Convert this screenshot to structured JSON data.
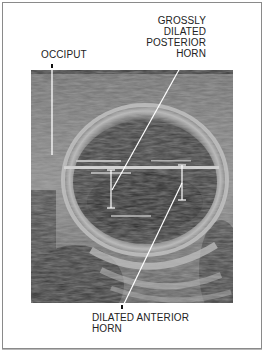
{
  "figure": {
    "type": "ultrasound-annotated",
    "labels": {
      "occiput": "OCCIPUT",
      "posterior_horn": [
        "GROSSLY",
        "DILATED",
        "POSTERIOR",
        "HORN"
      ],
      "anterior_horn": [
        "DILATED ANTERIOR",
        "HORN"
      ]
    },
    "colors": {
      "frame": "#8a8a8a",
      "text": "#222222",
      "pointer": "#ffffff"
    },
    "measurements": [
      {
        "name": "posterior-horn-caliper",
        "x": 111,
        "y1": 170,
        "y2": 208
      },
      {
        "name": "anterior-horn-caliper",
        "x": 182,
        "y1": 165,
        "y2": 200
      }
    ]
  }
}
